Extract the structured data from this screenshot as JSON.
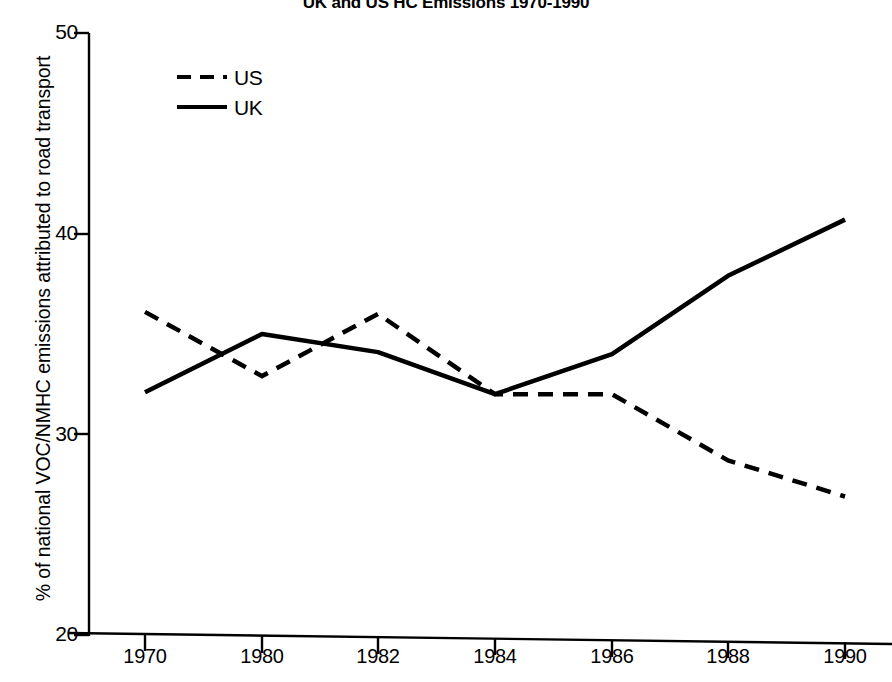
{
  "chart_data": {
    "type": "line",
    "title": "UK and US HC Emissions 1970-1990",
    "xlabel": "",
    "ylabel": "% of national VOC/NMHC emissions attributed to road transport",
    "categories": [
      "1970",
      "1980",
      "1982",
      "1984",
      "1986",
      "1988",
      "1990"
    ],
    "x_tick_labels": [
      "1970",
      "1980",
      "1982",
      "1984",
      "1986",
      "1988",
      "1990"
    ],
    "y_tick_labels": [
      "20",
      "30",
      "40",
      "50"
    ],
    "ylim": [
      20,
      50
    ],
    "y_ticks": [
      20,
      30,
      40,
      50
    ],
    "grid": false,
    "legend_position": "top-left",
    "series": [
      {
        "name": "US",
        "style": "dashed",
        "color": "#000000",
        "values": [
          36.1,
          32.9,
          36.0,
          32.0,
          32.0,
          28.7,
          26.9
        ]
      },
      {
        "name": "UK",
        "style": "solid",
        "color": "#000000",
        "values": [
          32.1,
          35.0,
          34.1,
          32.0,
          34.0,
          37.9,
          40.7
        ]
      }
    ]
  },
  "legend": {
    "entries": [
      {
        "label": "US",
        "style": "dashed"
      },
      {
        "label": "UK",
        "style": "solid"
      }
    ]
  },
  "axes": {
    "y_title": "% of national VOC/NMHC emissions attributed to road transport",
    "axis_color": "#000000"
  }
}
